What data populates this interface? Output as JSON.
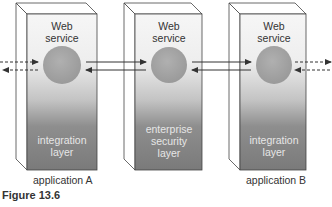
{
  "figure_caption": "Figure 13.6",
  "boxes": [
    {
      "id": "application-a",
      "top_label_1": "Web",
      "top_label_2": "service",
      "bottom_label_1": "integration",
      "bottom_label_2": "layer",
      "bottom_label_3": "",
      "caption": "application A"
    },
    {
      "id": "enterprise-security",
      "top_label_1": "Web",
      "top_label_2": "service",
      "bottom_label_1": "enterprise",
      "bottom_label_2": "security",
      "bottom_label_3": "layer",
      "caption": ""
    },
    {
      "id": "application-b",
      "top_label_1": "Web",
      "top_label_2": "service",
      "bottom_label_1": "integration",
      "bottom_label_2": "layer",
      "bottom_label_3": "",
      "caption": "application B"
    }
  ],
  "connections": [
    {
      "from": "external-left",
      "to": "application-a",
      "style": "dashed",
      "direction": "bidirectional"
    },
    {
      "from": "application-a",
      "to": "enterprise-security",
      "style": "solid",
      "direction": "bidirectional"
    },
    {
      "from": "enterprise-security",
      "to": "application-b",
      "style": "solid",
      "direction": "bidirectional"
    },
    {
      "from": "application-b",
      "to": "external-right",
      "style": "dashed",
      "direction": "bidirectional"
    }
  ],
  "colors": {
    "box_top": "#f4f4f4",
    "box_bottom": "#7a7a7a",
    "circle": "#a8a8a8",
    "outline": "#444444"
  }
}
